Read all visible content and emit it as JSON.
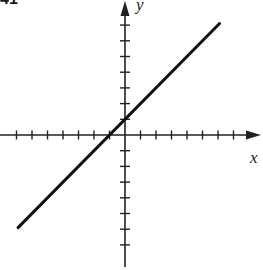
{
  "problem": {
    "number": "41"
  },
  "chart_data": {
    "type": "line",
    "title": "",
    "xlabel": "x",
    "ylabel": "y",
    "equation": "y = x + 1",
    "slope": 1,
    "y_intercept": 1,
    "x_intercept": -1,
    "xlim": [
      -7,
      7
    ],
    "ylim": [
      -7,
      7
    ],
    "x_ticks": [
      -7,
      -6,
      -5,
      -4,
      -3,
      -2,
      -1,
      1,
      2,
      3,
      4,
      5,
      6,
      7
    ],
    "y_ticks": [
      -7,
      -6,
      -5,
      -4,
      -3,
      -2,
      -1,
      1,
      2,
      3,
      4,
      5,
      6,
      7
    ],
    "tick_labels_shown": false,
    "grid": false,
    "series": [
      {
        "name": "line",
        "x": [
          -6.9,
          6.1
        ],
        "y": [
          -5.9,
          7.1
        ]
      }
    ],
    "colors": {
      "axis": "#222222",
      "line": "#111111"
    }
  }
}
